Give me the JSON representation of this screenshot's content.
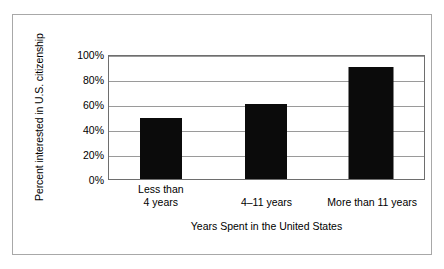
{
  "chart_data": {
    "type": "bar",
    "title": "",
    "subtitle": "",
    "categories": [
      "Less than 4 years",
      "4–11 years",
      "More than 11 years"
    ],
    "category_lines": [
      [
        "Less than",
        "4 years"
      ],
      [
        "4–11 years"
      ],
      [
        "More than 11 years"
      ]
    ],
    "values": [
      49,
      60,
      90
    ],
    "xlabel": "Years Spent in the United States",
    "ylabel": "Percent interested in U.S. citizenship",
    "ylim": [
      0,
      100
    ],
    "ytick_values": [
      0,
      20,
      40,
      60,
      80,
      100
    ],
    "ytick_labels": [
      "0%",
      "20%",
      "40%",
      "60%",
      "80%",
      "100%"
    ],
    "grid": "horizontal",
    "legend": "none",
    "bar_color": "#0b0b0b",
    "plot_border_color": "#6e6e6e",
    "gridline_color": "#9a9a9a",
    "figure_frame_color": "#a8a8a8",
    "background_color": "#ffffff",
    "value_suffix": "%"
  }
}
